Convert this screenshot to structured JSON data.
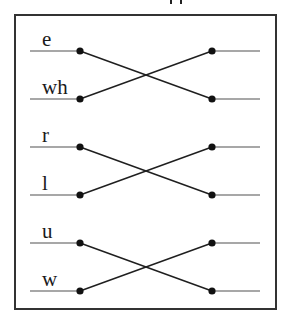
{
  "diagram": {
    "type": "crossing-pairs",
    "frame": {
      "x": 15,
      "y": 15,
      "width": 261,
      "height": 294,
      "stroke": "#333333"
    },
    "colors": {
      "stub_line": "#8a8a8a",
      "cross_line": "#1f1f1f",
      "dot": "#111111",
      "label": "#1a1a1a"
    },
    "geometry": {
      "stub_left_x1": 30,
      "left_dot_x": 80,
      "right_dot_x": 212,
      "stub_right_x2": 260,
      "label_x": 42
    },
    "pairs": [
      {
        "top": {
          "label": "e",
          "y": 51
        },
        "bottom": {
          "label": "wh",
          "y": 99
        }
      },
      {
        "top": {
          "label": "r",
          "y": 147
        },
        "bottom": {
          "label": "l",
          "y": 195
        }
      },
      {
        "top": {
          "label": "u",
          "y": 243
        },
        "bottom": {
          "label": "w",
          "y": 291
        }
      }
    ]
  }
}
